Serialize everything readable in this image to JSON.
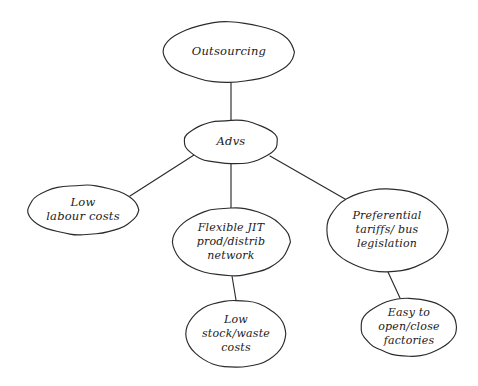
{
  "diagram": {
    "type": "mind-map",
    "title_node": "Outsourcing",
    "background_color": "#ffffff",
    "stroke_color": "#2b2b2b",
    "text_color": "#1a1a1a",
    "nodes": [
      {
        "id": "outsourcing",
        "lines": [
          "Outsourcing"
        ],
        "cx": 229,
        "cy": 52,
        "rx": 66,
        "ry": 30
      },
      {
        "id": "advs",
        "lines": [
          "Advs"
        ],
        "cx": 231,
        "cy": 142,
        "rx": 47,
        "ry": 22
      },
      {
        "id": "low-labour-costs",
        "lines": [
          "Low",
          "labour costs"
        ],
        "cx": 83,
        "cy": 210,
        "rx": 55,
        "ry": 25
      },
      {
        "id": "flexible-jit",
        "lines": [
          "Flexible JIT",
          "prod/distrib",
          "network"
        ],
        "cx": 231,
        "cy": 242,
        "rx": 59,
        "ry": 34
      },
      {
        "id": "preferential-tariffs",
        "lines": [
          "Preferential",
          "tariffs/ bus",
          "legislation"
        ],
        "cx": 387,
        "cy": 230,
        "rx": 61,
        "ry": 42
      },
      {
        "id": "low-stock-waste",
        "lines": [
          "Low",
          "stock/waste",
          "costs"
        ],
        "cx": 236,
        "cy": 334,
        "rx": 50,
        "ry": 34
      },
      {
        "id": "easy-open-close",
        "lines": [
          "Easy to",
          "open/close",
          "factories"
        ],
        "cx": 409,
        "cy": 327,
        "rx": 48,
        "ry": 29
      }
    ],
    "connectors": [
      {
        "id": "outsourcing-to-advs",
        "from": "outsourcing",
        "to": "advs",
        "path": "M 231 82 L 231 120"
      },
      {
        "id": "advs-to-low-labour-costs",
        "from": "advs",
        "to": "low-labour-costs",
        "path": "M 194 155 L 130 196"
      },
      {
        "id": "advs-to-flexible-jit",
        "from": "advs",
        "to": "flexible-jit",
        "path": "M 231 164 L 231 208"
      },
      {
        "id": "advs-to-preferential-tariffs",
        "from": "advs",
        "to": "preferential-tariffs",
        "path": "M 270 156 L 345 199"
      },
      {
        "id": "flexible-jit-to-low-stock-waste",
        "from": "flexible-jit",
        "to": "low-stock-waste",
        "path": "M 232 276 L 236 300"
      },
      {
        "id": "preferential-tariffs-to-easy-open-close",
        "from": "preferential-tariffs",
        "to": "easy-open-close",
        "path": "M 388 272 L 400 298"
      }
    ]
  }
}
